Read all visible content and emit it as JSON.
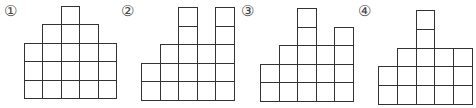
{
  "figures": [
    {
      "label": "①",
      "origin": [
        24,
        6
      ],
      "cell": 18.4,
      "rows_from_bottom": [
        [
          0,
          1,
          2,
          3,
          4
        ],
        [
          0,
          1,
          2,
          3,
          4
        ],
        [
          0,
          1,
          2,
          3,
          4
        ],
        [
          1,
          2,
          3
        ],
        [
          2
        ]
      ]
    },
    {
      "label": "②",
      "origin": [
        141,
        7
      ],
      "cell": 18.6,
      "rows_from_bottom": [
        [
          0,
          1,
          2,
          3,
          4
        ],
        [
          0,
          1,
          2,
          3,
          4
        ],
        [
          1,
          2,
          3,
          4
        ],
        [
          2,
          4
        ],
        [
          2,
          4
        ]
      ]
    },
    {
      "label": "③",
      "origin": [
        260,
        8
      ],
      "cell": 18.6,
      "rows_from_bottom": [
        [
          0,
          1,
          2,
          3,
          4
        ],
        [
          0,
          1,
          2,
          3,
          4
        ],
        [
          1,
          2,
          3,
          4
        ],
        [
          2,
          4
        ],
        [
          2
        ]
      ]
    },
    {
      "label": "④",
      "origin": [
        378,
        10
      ],
      "cell": 18.8,
      "rows_from_bottom": [
        [
          0,
          1,
          2,
          3,
          4
        ],
        [
          0,
          1,
          2,
          3,
          4
        ],
        [
          1,
          2,
          3,
          4
        ],
        [
          2
        ],
        [
          2
        ]
      ]
    }
  ],
  "labels": {
    "fig1": "①",
    "fig2": "②",
    "fig3": "③",
    "fig4": "④"
  }
}
